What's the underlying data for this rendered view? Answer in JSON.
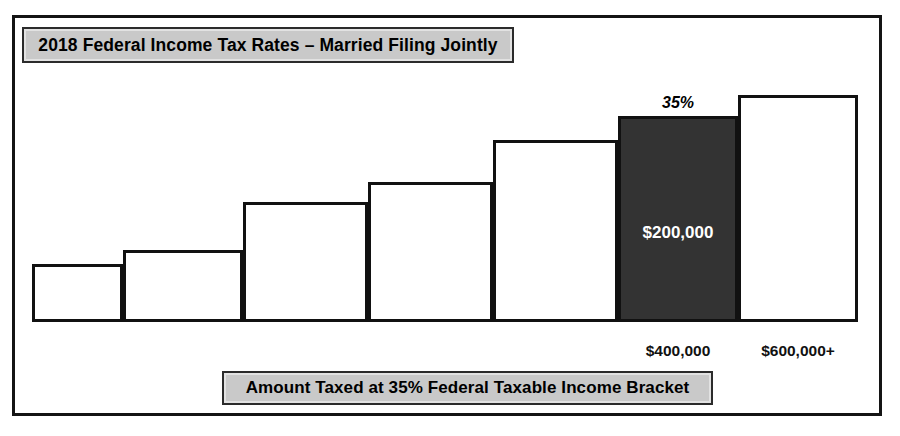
{
  "figure": {
    "title": "2018 Federal Income Tax Rates – Married Filing Jointly",
    "caption": "Amount Taxed at 35% Federal Taxable Income Bracket",
    "frame_color": "#141414",
    "banner_fill": "#c9c9c9",
    "highlight_fill": "#333333",
    "bar_outline": "#111111"
  },
  "chart_data": {
    "type": "bar",
    "title": "2018 Federal Income Tax Rates – Married Filing Jointly",
    "subtitle": "Amount Taxed at 35% Federal Taxable Income Bracket",
    "xlabel": "",
    "ylabel": "",
    "grid": false,
    "legend": false,
    "orientation": "vertical-step",
    "categories": [
      "10%",
      "12%",
      "22%",
      "24%",
      "32%",
      "35%",
      "37%"
    ],
    "values": [
      58,
      72,
      120,
      140,
      182,
      206,
      227
    ],
    "bracket_start_labels": [
      "",
      "",
      "",
      "",
      "",
      "$400,000",
      "$600,000+"
    ],
    "highlighted_index": 5,
    "highlighted_rate": "35%",
    "highlighted_amount": "$200,000",
    "annotations": [
      {
        "text": "35%",
        "position": "above-bar-6",
        "style": "bold-italic"
      },
      {
        "text": "$200,000",
        "position": "inside-bar-6",
        "style": "bold-white"
      },
      {
        "text": "$400,000",
        "position": "below-bar-6-left-edge",
        "style": "bold"
      },
      {
        "text": "$600,000+",
        "position": "below-bar-7-left-edge",
        "style": "bold"
      }
    ],
    "bars": [
      {
        "index": 0,
        "label": "bracket-1",
        "x": 32,
        "width": 91,
        "top": 264,
        "height": 58,
        "fill": "#ffffff"
      },
      {
        "index": 1,
        "label": "bracket-2",
        "x": 123,
        "width": 120,
        "top": 250,
        "height": 72,
        "fill": "#ffffff"
      },
      {
        "index": 2,
        "label": "bracket-3",
        "x": 243,
        "width": 125,
        "top": 202,
        "height": 120,
        "fill": "#ffffff"
      },
      {
        "index": 3,
        "label": "bracket-4",
        "x": 368,
        "width": 125,
        "top": 182,
        "height": 140,
        "fill": "#ffffff"
      },
      {
        "index": 4,
        "label": "bracket-5",
        "x": 493,
        "width": 125,
        "top": 140,
        "height": 182,
        "fill": "#ffffff"
      },
      {
        "index": 5,
        "label": "bracket-6",
        "x": 618,
        "width": 120,
        "top": 116,
        "height": 206,
        "fill": "#333333"
      },
      {
        "index": 6,
        "label": "bracket-7",
        "x": 738,
        "width": 120,
        "top": 95,
        "height": 227,
        "fill": "#ffffff"
      }
    ],
    "baseline_y": 322
  },
  "labels": {
    "rate_35": "35%",
    "amount_200k": "$200,000",
    "tick_400k": "$400,000",
    "tick_600k": "$600,000+"
  }
}
